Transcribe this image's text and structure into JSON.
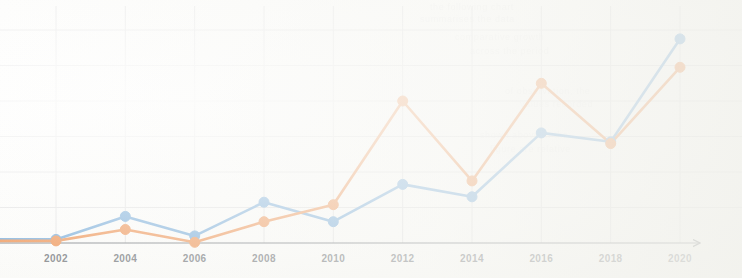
{
  "chart_data": {
    "type": "line",
    "title": "",
    "subtitle": "",
    "xlabel": "",
    "ylabel": "",
    "categories": [
      "2002",
      "2004",
      "2006",
      "2008",
      "2010",
      "2012",
      "2014",
      "2016",
      "2018",
      "2020"
    ],
    "x": [
      2002,
      2004,
      2006,
      2008,
      2010,
      2012,
      2014,
      2016,
      2018,
      2020
    ],
    "xlim": [
      2002,
      2020
    ],
    "ylim": [
      0,
      7
    ],
    "grid": true,
    "grid_color": "#dcdcde",
    "legend": "none",
    "axis_arrow": true,
    "markers": "circle",
    "series": [
      {
        "name": "series-blue",
        "color": "#5B9BD5",
        "values": [
          0.1,
          0.75,
          0.2,
          1.15,
          0.6,
          1.65,
          1.3,
          3.1,
          2.85,
          5.75
        ]
      },
      {
        "name": "series-orange",
        "color": "#ED7D31",
        "values": [
          0.06,
          0.38,
          0.02,
          0.6,
          1.08,
          4.0,
          1.75,
          4.5,
          2.8,
          4.95
        ]
      }
    ],
    "y_gridline_values": [
      0,
      1,
      2,
      3,
      4,
      5,
      6
    ]
  },
  "background": {
    "ghost_text": [
      "the following chart",
      "summarises the data",
      "comparative growth",
      "across the period",
      "of observation, the",
      "values recorded",
      "shown above in the",
      "figure are relative"
    ]
  }
}
